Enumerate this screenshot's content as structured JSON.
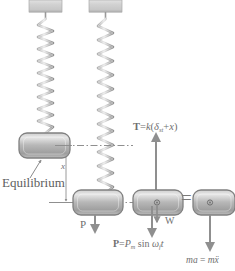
{
  "diagram": {
    "type": "physics-free-body-diagram",
    "colors": {
      "line": "#8a8a8a",
      "block_fill_light": "#d8d8d8",
      "block_fill_dark": "#9b9b9b",
      "block_stroke": "#7a7a7a",
      "text": "#6f6f6f",
      "support_fill": "#d4d4d4",
      "background": "#ffffff"
    },
    "labels": {
      "equilibrium": "Equilibrium",
      "displacement": "x",
      "tension": "T = k(δst + x)",
      "tension_parts": {
        "symbol": "T",
        "equals": "=",
        "stiffness": "k",
        "open": "(",
        "delta": "δ",
        "subscript": "st",
        "plus": "+",
        "variable": "x",
        "close": ")"
      },
      "applied_force_left": "P",
      "weight": "W",
      "applied_force": "P = Pm sin ωf t",
      "applied_force_parts": {
        "symbol": "P",
        "equals": "=",
        "amplitude": "P",
        "amplitude_sub": "m",
        "sin": "sin",
        "omega": "ω",
        "omega_sub": "f",
        "time": "t"
      },
      "inertia": "ma = mẍ",
      "inertia_parts": {
        "mass": "m",
        "accel": "a",
        "equals": "=",
        "mass2": "m",
        "xddot": "ẍ"
      },
      "equals_sign": "="
    },
    "elements": {
      "support_left": "ceiling-support-block",
      "support_right": "ceiling-support-block",
      "spring_left": "coil-spring",
      "spring_right": "coil-spring",
      "block_equilibrium": "mass-block",
      "block_displaced": "mass-block",
      "block_fbd": "mass-block-free-body",
      "block_inertia": "mass-block-inertia",
      "datum_line": "dash-dot-equilibrium-line",
      "displacement_dimension": "x-dimension-arrow",
      "leader_equilibrium": "equilibrium-leader-arrow"
    }
  }
}
